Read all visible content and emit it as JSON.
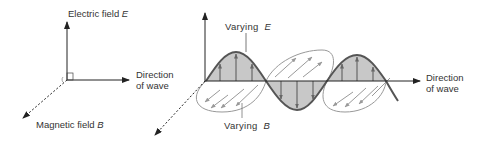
{
  "left_diagram": {
    "electric_field_label": "Electric field",
    "electric_field_symbol": "E",
    "magnetic_field_label": "Magnetic field",
    "magnetic_field_symbol": "B",
    "direction_label_line1": "Direction",
    "direction_label_line2": "of wave"
  },
  "right_diagram": {
    "varying_e_label": "Varying",
    "varying_e_symbol": "E",
    "varying_b_label": "Varying",
    "varying_b_symbol": "B",
    "direction_label_line1": "Direction",
    "direction_label_line2": "of wave"
  },
  "colors": {
    "axis": "#222222",
    "e_wave": "#555555",
    "e_fill": "#c8c8c8",
    "b_wave": "#888888",
    "text": "#333333"
  }
}
